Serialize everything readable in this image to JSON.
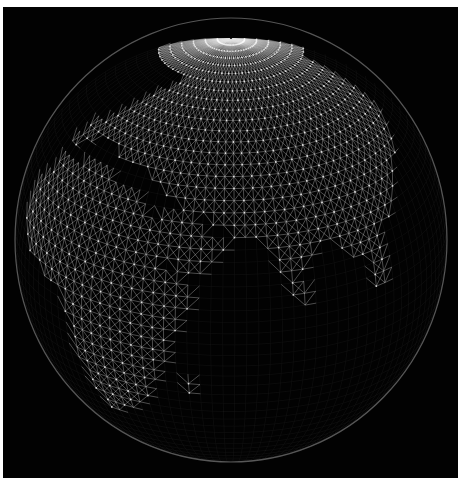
{
  "image": {
    "width": 465,
    "height": 494,
    "background_color": "#ffffff",
    "frame": {
      "x": 3,
      "y": 7,
      "width": 455,
      "height": 471,
      "color": "#020202"
    }
  },
  "globe": {
    "center_x": 231,
    "center_y": 240,
    "radius_x": 216,
    "radius_y": 222,
    "center_lon": 60,
    "center_lat": 25,
    "rim_color": "#9a9a9a",
    "mesh": {
      "lat_step": 3.2,
      "lon_step": 3.2,
      "ocean_line_color": "#8c8c8c",
      "ocean_line_opacity": 0.1,
      "land_line_color": "#e6e6e6",
      "land_line_opacity": 0.55,
      "node_color": "#ffffff"
    },
    "land_regions": [
      {
        "name": "africa",
        "points": [
          [
            -17,
            21
          ],
          [
            -10,
            32
          ],
          [
            10,
            37
          ],
          [
            33,
            31
          ],
          [
            43,
            12
          ],
          [
            51,
            11
          ],
          [
            40,
            -15
          ],
          [
            33,
            -27
          ],
          [
            20,
            -35
          ],
          [
            13,
            -18
          ],
          [
            9,
            0
          ],
          [
            -8,
            5
          ],
          [
            -17,
            14
          ]
        ]
      },
      {
        "name": "arabia",
        "points": [
          [
            35,
            31
          ],
          [
            48,
            30
          ],
          [
            56,
            24
          ],
          [
            59,
            22
          ],
          [
            52,
            16
          ],
          [
            45,
            12
          ],
          [
            42,
            16
          ],
          [
            36,
            27
          ]
        ]
      },
      {
        "name": "eurasia",
        "points": [
          [
            -10,
            36
          ],
          [
            -9,
            44
          ],
          [
            2,
            51
          ],
          [
            8,
            58
          ],
          [
            25,
            70
          ],
          [
            60,
            70
          ],
          [
            100,
            72
          ],
          [
            140,
            72
          ],
          [
            140,
            45
          ],
          [
            122,
            30
          ],
          [
            110,
            20
          ],
          [
            100,
            13
          ],
          [
            95,
            16
          ],
          [
            90,
            22
          ],
          [
            80,
            15
          ],
          [
            77,
            8
          ],
          [
            72,
            20
          ],
          [
            67,
            25
          ],
          [
            57,
            26
          ],
          [
            52,
            30
          ],
          [
            48,
            30
          ],
          [
            36,
            36
          ],
          [
            27,
            41
          ],
          [
            20,
            40
          ],
          [
            15,
            38
          ],
          [
            12,
            44
          ],
          [
            3,
            42
          ]
        ]
      },
      {
        "name": "india-south",
        "points": [
          [
            72,
            20
          ],
          [
            77,
            8
          ],
          [
            80,
            15
          ],
          [
            85,
            20
          ],
          [
            88,
            22
          ],
          [
            80,
            25
          ]
        ]
      },
      {
        "name": "southeast-asia",
        "points": [
          [
            95,
            16
          ],
          [
            100,
            13
          ],
          [
            104,
            2
          ],
          [
            109,
            12
          ],
          [
            108,
            20
          ],
          [
            100,
            21
          ]
        ]
      },
      {
        "name": "madagascar",
        "points": [
          [
            44,
            -25
          ],
          [
            49,
            -12
          ],
          [
            50,
            -16
          ],
          [
            47,
            -25
          ]
        ]
      },
      {
        "name": "sri-lanka",
        "points": [
          [
            79.7,
            6
          ],
          [
            81.8,
            6
          ],
          [
            81.5,
            9.5
          ],
          [
            80,
            9.8
          ]
        ]
      }
    ]
  }
}
